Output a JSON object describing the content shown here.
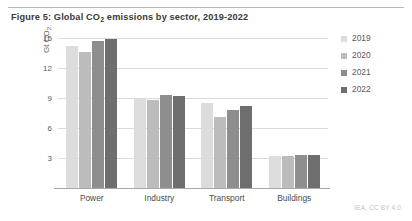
{
  "caption": {
    "prefix": "Figure 5: Global CO",
    "subscript": "2",
    "suffix": " emissions by sector, 2019-2022"
  },
  "axis_title": {
    "prefix": "Gt CO",
    "subscript": "2"
  },
  "credit": "IEA. CC BY 4.0.",
  "legend": {
    "items": [
      {
        "label": "2019",
        "color": "#dcdcdc"
      },
      {
        "label": "2020",
        "color": "#bcbcbc"
      },
      {
        "label": "2021",
        "color": "#8e8e8e"
      },
      {
        "label": "2022",
        "color": "#6e6e6e"
      }
    ]
  },
  "chart_data": {
    "type": "bar",
    "title": "Figure 5: Global CO2 emissions by sector, 2019-2022",
    "xlabel": "",
    "ylabel": "Gt CO2",
    "ylim": [
      0,
      15
    ],
    "yticks": [
      3,
      6,
      9,
      12,
      15
    ],
    "grid": true,
    "legend_position": "right",
    "categories": [
      "Power",
      "Industry",
      "Transport",
      "Buildings"
    ],
    "series": [
      {
        "name": "2019",
        "color": "#dcdcdc",
        "values": [
          14.2,
          8.9,
          8.5,
          3.2
        ]
      },
      {
        "name": "2020",
        "color": "#bcbcbc",
        "values": [
          13.6,
          8.8,
          7.1,
          3.2
        ]
      },
      {
        "name": "2021",
        "color": "#8e8e8e",
        "values": [
          14.7,
          9.3,
          7.8,
          3.3
        ]
      },
      {
        "name": "2022",
        "color": "#6e6e6e",
        "values": [
          14.9,
          9.2,
          8.2,
          3.3
        ]
      }
    ]
  }
}
